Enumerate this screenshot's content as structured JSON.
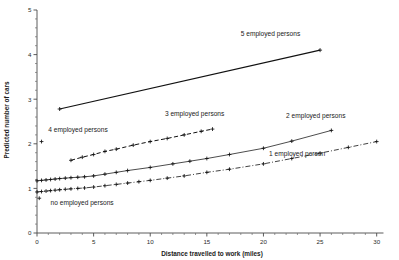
{
  "chart_data": {
    "type": "line",
    "title": "",
    "xlabel": "Distance travelled to work (miles)",
    "ylabel": "Predicted number of cars",
    "xlim": [
      0,
      31
    ],
    "ylim": [
      0,
      5
    ],
    "grid": false,
    "legend_position": "inline-annotations",
    "x_ticks_major": [
      0,
      5,
      10,
      15,
      20,
      25,
      30
    ],
    "x_tick_labels": [
      "0",
      "5",
      "10",
      "15",
      "20",
      "25",
      "30"
    ],
    "y_ticks_major": [
      0,
      1,
      2,
      3,
      4,
      5
    ],
    "y_tick_labels": [
      "0",
      "1",
      "2",
      "3",
      "4",
      "5"
    ],
    "series": [
      {
        "name": "5 employed persons",
        "label": "5 employed persons",
        "style": "solid-thick",
        "label_x": 18.0,
        "label_y": 4.42,
        "x": [
          2.0,
          25.0
        ],
        "y": [
          2.78,
          4.1
        ]
      },
      {
        "name": "4 employed persons",
        "label": "4 employed persons",
        "style": "points-only",
        "label_x": 1.0,
        "label_y": 2.27,
        "x": [
          0.4
        ],
        "y": [
          2.05
        ]
      },
      {
        "name": "3 employed persons",
        "label": "3 employed persons",
        "style": "dashed",
        "label_x": 11.3,
        "label_y": 2.62,
        "x": [
          3.0,
          4.0,
          5.0,
          6.0,
          7.0,
          8.5,
          10.0,
          11.5,
          13.0,
          14.5,
          15.5
        ],
        "y": [
          1.63,
          1.7,
          1.76,
          1.83,
          1.88,
          1.97,
          2.05,
          2.12,
          2.2,
          2.28,
          2.33
        ]
      },
      {
        "name": "2 employed persons",
        "label": "2 employed persons",
        "style": "solid-thin",
        "label_x": 22.0,
        "label_y": 2.57,
        "x": [
          0.0,
          0.4,
          0.8,
          1.2,
          1.6,
          2.0,
          2.5,
          3.0,
          3.6,
          4.2,
          5.0,
          6.0,
          7.0,
          8.0,
          10.0,
          12.0,
          13.5,
          15.0,
          17.0,
          20.0,
          22.5,
          26.0
        ],
        "y": [
          1.17,
          1.18,
          1.19,
          1.2,
          1.21,
          1.22,
          1.23,
          1.24,
          1.25,
          1.26,
          1.28,
          1.32,
          1.36,
          1.4,
          1.47,
          1.55,
          1.61,
          1.67,
          1.76,
          1.9,
          2.06,
          2.3
        ]
      },
      {
        "name": "1 employed person",
        "label": "1 employed person",
        "style": "dash-dot",
        "label_x": 20.5,
        "label_y": 1.72,
        "x": [
          0.0,
          0.4,
          0.8,
          1.2,
          1.6,
          2.0,
          2.5,
          3.0,
          3.6,
          4.2,
          5.0,
          6.0,
          7.0,
          8.0,
          9.0,
          10.0,
          11.5,
          13.0,
          15.0,
          17.0,
          20.0,
          22.5,
          25.0,
          27.5,
          30.0
        ],
        "y": [
          0.92,
          0.93,
          0.94,
          0.95,
          0.96,
          0.97,
          0.98,
          0.99,
          1.0,
          1.01,
          1.03,
          1.06,
          1.09,
          1.12,
          1.15,
          1.18,
          1.23,
          1.28,
          1.36,
          1.43,
          1.55,
          1.67,
          1.79,
          1.92,
          2.05
        ]
      },
      {
        "name": "no employed persons",
        "label": "no employed persons",
        "style": "points-only",
        "label_x": 1.2,
        "label_y": 0.62,
        "x": [
          0.2
        ],
        "y": [
          0.78
        ]
      }
    ]
  }
}
